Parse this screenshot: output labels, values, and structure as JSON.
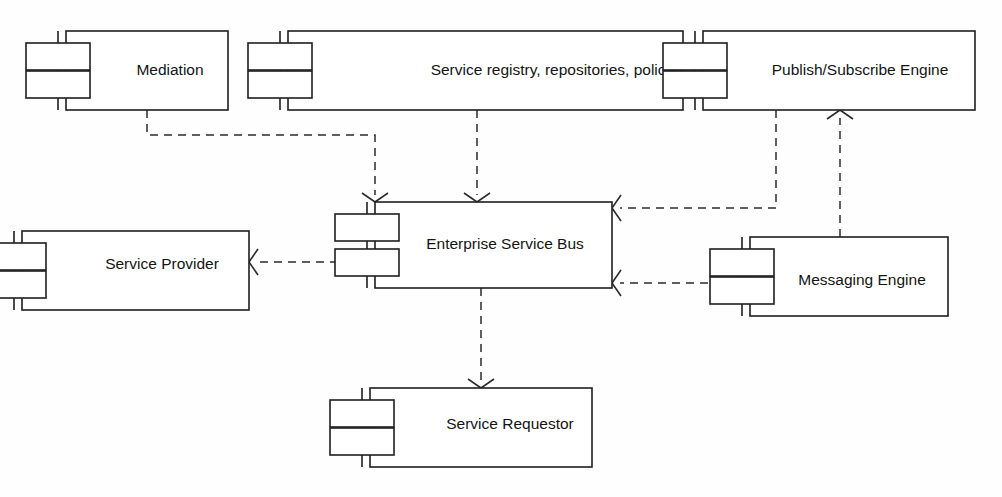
{
  "diagram": {
    "kind": "uml-component-diagram",
    "background_color": "#fefefe",
    "line_color": "#1f1f1f",
    "dependency_style": "dashed-open-arrow",
    "components": [
      {
        "id": "mediation",
        "label": "Mediation",
        "x": 66,
        "y": 31,
        "w": 162,
        "h": 79,
        "label_x": 170,
        "label_y": 71
      },
      {
        "id": "service-registry",
        "label": "Service registry, repositories, policies",
        "x": 288,
        "y": 31,
        "w": 395,
        "h": 79,
        "label_x": 558,
        "label_y": 71
      },
      {
        "id": "publish-subscribe-engine",
        "label": "Publish/Subscribe Engine",
        "x": 703,
        "y": 31,
        "w": 272,
        "h": 79,
        "label_x": 860,
        "label_y": 71
      },
      {
        "id": "service-provider",
        "label": "Service Provider",
        "x": 22,
        "y": 231,
        "w": 227,
        "h": 79,
        "label_x": 162,
        "label_y": 265
      },
      {
        "id": "enterprise-service-bus",
        "label": "Enterprise Service Bus",
        "x": 375,
        "y": 202,
        "w": 237,
        "h": 86,
        "label_x": 505,
        "label_y": 245
      },
      {
        "id": "messaging-engine",
        "label": "Messaging Engine",
        "x": 750,
        "y": 237,
        "w": 198,
        "h": 79,
        "label_x": 862,
        "label_y": 281
      },
      {
        "id": "service-requestor",
        "label": "Service Requestor",
        "x": 370,
        "y": 388,
        "w": 222,
        "h": 79,
        "label_x": 510,
        "label_y": 425
      }
    ],
    "dependencies": [
      {
        "id": "mediation-to-esb",
        "from": "mediation",
        "to": "enterprise-service-bus",
        "points": "147,110 147,135 375,135 375,195",
        "arrow_at": "375,202",
        "arrow_dir": "down"
      },
      {
        "id": "registry-to-esb",
        "from": "service-registry",
        "to": "enterprise-service-bus",
        "points": "477,110 477,195",
        "arrow_at": "477,202",
        "arrow_dir": "down"
      },
      {
        "id": "pubsub-to-esb",
        "from": "publish-subscribe-engine",
        "to": "enterprise-service-bus",
        "points": "776,110 776,208 620,208",
        "arrow_at": "612,208",
        "arrow_dir": "left"
      },
      {
        "id": "messaging-to-pubsub",
        "from": "messaging-engine",
        "to": "publish-subscribe-engine",
        "points": "840,237 840,118",
        "arrow_at": "840,110",
        "arrow_dir": "up"
      },
      {
        "id": "messaging-to-esb",
        "from": "messaging-engine",
        "to": "enterprise-service-bus",
        "points": "750,283 620,283",
        "arrow_at": "612,283",
        "arrow_dir": "left"
      },
      {
        "id": "esb-to-service-provider",
        "from": "enterprise-service-bus",
        "to": "service-provider",
        "points": "352,262 257,262",
        "arrow_at": "249,262",
        "arrow_dir": "left"
      },
      {
        "id": "esb-to-service-requestor",
        "from": "enterprise-service-bus",
        "to": "service-requestor",
        "points": "481,288 481,381",
        "arrow_at": "481,388",
        "arrow_dir": "down"
      }
    ]
  }
}
